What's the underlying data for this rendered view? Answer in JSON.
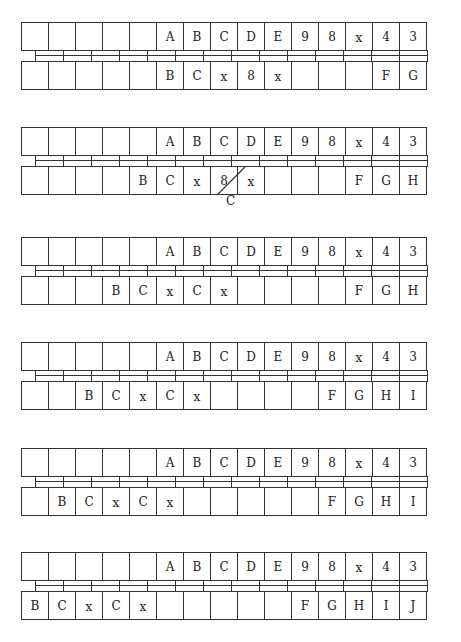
{
  "diagram": {
    "columns": 15,
    "line_color": "#333333",
    "groups": [
      {
        "top": [
          "",
          "",
          "",
          "",
          "",
          "A",
          "B",
          "C",
          "D",
          "E",
          "9",
          "8",
          "x",
          "4",
          "3"
        ],
        "bottom": [
          "",
          "",
          "",
          "",
          "",
          "B",
          "C",
          "x",
          "8",
          "x",
          "",
          "",
          "",
          "F",
          "G"
        ]
      },
      {
        "top": [
          "",
          "",
          "",
          "",
          "",
          "A",
          "B",
          "C",
          "D",
          "E",
          "9",
          "8",
          "x",
          "4",
          "3"
        ],
        "bottom": [
          "",
          "",
          "",
          "",
          "B",
          "C",
          "x",
          "8",
          "x",
          "",
          "",
          "",
          "F",
          "G",
          "H"
        ],
        "strike": {
          "column": 7,
          "replacement": "C"
        }
      },
      {
        "top": [
          "",
          "",
          "",
          "",
          "",
          "A",
          "B",
          "C",
          "D",
          "E",
          "9",
          "8",
          "x",
          "4",
          "3"
        ],
        "bottom": [
          "",
          "",
          "",
          "B",
          "C",
          "x",
          "C",
          "x",
          "",
          "",
          "",
          "",
          "F",
          "G",
          "H"
        ]
      },
      {
        "top": [
          "",
          "",
          "",
          "",
          "",
          "A",
          "B",
          "C",
          "D",
          "E",
          "9",
          "8",
          "x",
          "4",
          "3"
        ],
        "bottom": [
          "",
          "",
          "B",
          "C",
          "x",
          "C",
          "x",
          "",
          "",
          "",
          "",
          "F",
          "G",
          "H",
          "I"
        ]
      },
      {
        "top": [
          "",
          "",
          "",
          "",
          "",
          "A",
          "B",
          "C",
          "D",
          "E",
          "9",
          "8",
          "x",
          "4",
          "3"
        ],
        "bottom": [
          "",
          "B",
          "C",
          "x",
          "C",
          "x",
          "",
          "",
          "",
          "",
          "",
          "F",
          "G",
          "H",
          "I"
        ]
      },
      {
        "top": [
          "",
          "",
          "",
          "",
          "",
          "A",
          "B",
          "C",
          "D",
          "E",
          "9",
          "8",
          "x",
          "4",
          "3"
        ],
        "bottom": [
          "B",
          "C",
          "x",
          "C",
          "x",
          "",
          "",
          "",
          "",
          "",
          "F",
          "G",
          "H",
          "I",
          "J"
        ]
      }
    ]
  }
}
